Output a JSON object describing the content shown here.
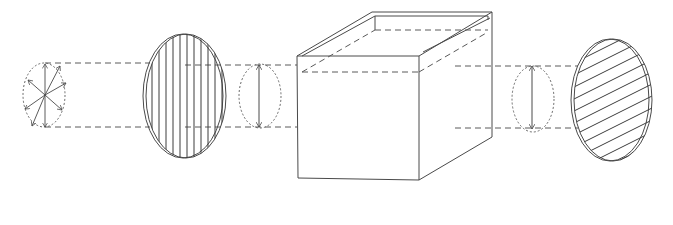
{
  "figure": {
    "components": [
      {
        "id": "unpolarized-light",
        "icon": "multi-direction-arrows"
      },
      {
        "id": "polarizer",
        "hatch": "vertical"
      },
      {
        "id": "polarized-light-1",
        "icon": "vertical-double-arrow"
      },
      {
        "id": "sample-cell",
        "shape": "open-top-box"
      },
      {
        "id": "polarized-light-2",
        "icon": "vertical-double-arrow"
      },
      {
        "id": "analyzer",
        "hatch": "diagonal"
      }
    ],
    "colors": {
      "line": "#4a4a4a",
      "background": "#ffffff"
    }
  }
}
